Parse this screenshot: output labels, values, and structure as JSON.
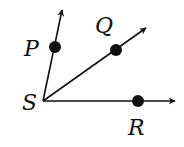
{
  "diagram": {
    "vertex": {
      "label": "S",
      "x": 43,
      "y": 101,
      "label_x": 22,
      "label_y": 110
    },
    "rays": [
      {
        "name": "SP",
        "point": {
          "label": "P",
          "x": 55,
          "y": 47,
          "label_x": 24,
          "label_y": 56
        },
        "tip": {
          "x": 62,
          "y": 10
        }
      },
      {
        "name": "SQ",
        "point": {
          "label": "Q",
          "x": 116,
          "y": 50,
          "label_x": 95,
          "label_y": 33
        },
        "tip": {
          "x": 146,
          "y": 28
        }
      },
      {
        "name": "SR",
        "point": {
          "label": "R",
          "x": 138,
          "y": 101,
          "label_x": 128,
          "label_y": 135
        },
        "tip": {
          "x": 175,
          "y": 101
        }
      }
    ],
    "colors": {
      "stroke": "#111111",
      "background": "#ffffff"
    }
  }
}
